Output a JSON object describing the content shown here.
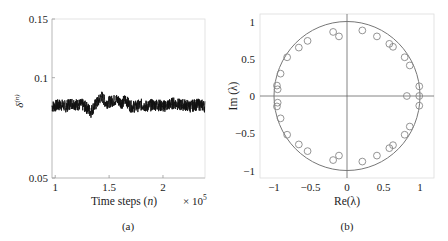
{
  "chart_data": [
    {
      "type": "line",
      "panel_label": "(a)",
      "title": "",
      "xlabel": "Time steps (n)",
      "xlabel_parts": {
        "text": "Time steps (",
        "var": "n",
        "close": ")"
      },
      "x_multiplier": "× 10^5",
      "x_multiplier_parts": {
        "base": "× 10",
        "exp": "5"
      },
      "ylabel": "δ^(n)",
      "ylabel_parts": {
        "base": "δ",
        "sup": "(n)"
      },
      "xlim": [
        0.97,
        2.39
      ],
      "ylim": [
        0.05,
        0.15
      ],
      "xticks": [
        1,
        1.5,
        2
      ],
      "xtick_labels": [
        "1",
        "1.5",
        "2"
      ],
      "yticks": [
        0.05,
        0.1,
        0.15
      ],
      "ytick_labels": [
        "0.05",
        "0.1",
        "0.15"
      ],
      "yscale": "log",
      "grid": false,
      "series": [
        {
          "name": "δ^(n)",
          "color": "#111111",
          "x": [
            0.97,
            1.05,
            1.1,
            1.15,
            1.2,
            1.25,
            1.3,
            1.33,
            1.36,
            1.4,
            1.43,
            1.47,
            1.52,
            1.57,
            1.62,
            1.65,
            1.7,
            1.75,
            1.8,
            1.85,
            1.9,
            1.95,
            2.0,
            2.05,
            2.1,
            2.15,
            2.2,
            2.25,
            2.3,
            2.35,
            2.39
          ],
          "values": [
            0.082,
            0.083,
            0.082,
            0.084,
            0.083,
            0.083,
            0.081,
            0.079,
            0.082,
            0.085,
            0.088,
            0.084,
            0.085,
            0.086,
            0.084,
            0.086,
            0.082,
            0.082,
            0.083,
            0.082,
            0.083,
            0.083,
            0.082,
            0.083,
            0.084,
            0.083,
            0.083,
            0.082,
            0.083,
            0.083,
            0.082
          ],
          "noise_band": 0.0035
        }
      ]
    },
    {
      "type": "scatter",
      "panel_label": "(b)",
      "title": "",
      "xlabel": "Re(λ)",
      "ylabel": "Im (λ)",
      "xlim": [
        -1.2,
        1.2
      ],
      "ylim": [
        -1.1,
        1.1
      ],
      "xticks": [
        -1,
        -0.5,
        0,
        0.5,
        1
      ],
      "xtick_labels": [
        "−1",
        "−0.5",
        "0",
        "0.5",
        "1"
      ],
      "yticks": [
        -1,
        -0.5,
        0,
        0.5,
        1
      ],
      "ytick_labels": [
        "−1",
        "−0.5",
        "0",
        "0.5",
        "1"
      ],
      "grid": false,
      "annotations": [
        "unit circle",
        "zero axes"
      ],
      "series": [
        {
          "name": "eigenvalues",
          "marker": "open-circle",
          "color": "#888888",
          "points": [
            [
              -0.19,
              0.86
            ],
            [
              -0.11,
              0.8
            ],
            [
              -0.54,
              0.74
            ],
            [
              -0.66,
              0.65
            ],
            [
              -0.82,
              0.52
            ],
            [
              -0.91,
              0.3
            ],
            [
              -0.96,
              0.14
            ],
            [
              -0.95,
              0.09
            ],
            [
              0.21,
              0.88
            ],
            [
              0.41,
              0.8
            ],
            [
              0.58,
              0.7
            ],
            [
              0.63,
              0.66
            ],
            [
              0.79,
              0.52
            ],
            [
              0.86,
              0.41
            ],
            [
              0.99,
              0.13
            ],
            [
              -0.19,
              -0.86
            ],
            [
              -0.11,
              -0.8
            ],
            [
              -0.54,
              -0.74
            ],
            [
              -0.66,
              -0.65
            ],
            [
              -0.82,
              -0.52
            ],
            [
              -0.91,
              -0.3
            ],
            [
              -0.96,
              -0.14
            ],
            [
              -0.95,
              -0.09
            ],
            [
              0.21,
              -0.88
            ],
            [
              0.41,
              -0.8
            ],
            [
              0.58,
              -0.7
            ],
            [
              0.63,
              -0.66
            ],
            [
              0.79,
              -0.52
            ],
            [
              0.86,
              -0.41
            ],
            [
              0.99,
              -0.13
            ],
            [
              0.82,
              0.0
            ],
            [
              0.99,
              0.0
            ]
          ]
        }
      ]
    }
  ],
  "panels": {
    "a": {
      "label": "(a)"
    },
    "b": {
      "label": "(b)"
    }
  }
}
